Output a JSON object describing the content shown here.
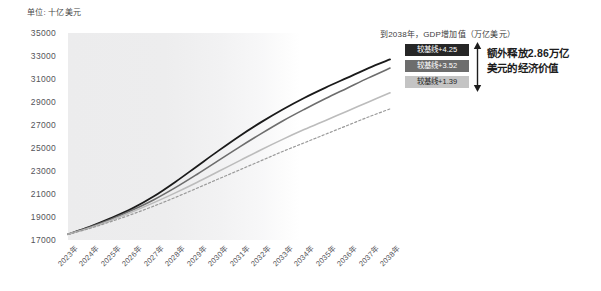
{
  "unit_label": "单位: 十亿美元",
  "annotation": {
    "title": "到2038年，GDP增加值（万亿美元）",
    "badges": [
      {
        "label": "较基线+4.25",
        "color": "#262626",
        "text_color": "#ffffff"
      },
      {
        "label": "较基线+3.52",
        "color": "#6d6d6d",
        "text_color": "#ffffff"
      },
      {
        "label": "较基线+1.39",
        "color": "#c4c4c4",
        "text_color": "#1f1f1f"
      }
    ],
    "arrow_icon": "double-headed-vertical-arrow",
    "callout_line1": "额外释放2.86万亿",
    "callout_line2": "美元的经济价值"
  },
  "chart_data": {
    "type": "line",
    "title": "",
    "xlabel": "",
    "ylabel": "单位: 十亿美元",
    "ylim": [
      17000,
      35000
    ],
    "ytick_step": 2000,
    "grid": false,
    "legend": "none",
    "categories": [
      "2023年",
      "2024年",
      "2025年",
      "2026年",
      "2027年",
      "2028年",
      "2029年",
      "2030年",
      "2031年",
      "2032年",
      "2033年",
      "2034年",
      "2035年",
      "2036年",
      "2037年",
      "2038年"
    ],
    "yticks": [
      35000,
      33000,
      31000,
      29000,
      27000,
      25000,
      23000,
      21000,
      19000,
      17000
    ],
    "series": [
      {
        "name": "较基线+4.25",
        "style": "solid",
        "color": "#1a1a1a",
        "width": 1.8,
        "values": [
          17500,
          18150,
          18900,
          19750,
          20800,
          22050,
          23400,
          24750,
          26050,
          27250,
          28350,
          29350,
          30250,
          31100,
          31950,
          32700
        ]
      },
      {
        "name": "较基线+3.52",
        "style": "solid",
        "color": "#6d6d6d",
        "width": 1.6,
        "values": [
          17500,
          18100,
          18800,
          19600,
          20500,
          21550,
          22700,
          23900,
          25100,
          26250,
          27350,
          28350,
          29300,
          30200,
          31100,
          31950
        ]
      },
      {
        "name": "较基线+1.39",
        "style": "solid",
        "color": "#bcbcbc",
        "width": 1.6,
        "values": [
          17500,
          18050,
          18700,
          19450,
          20250,
          21100,
          22000,
          22950,
          23900,
          24850,
          25750,
          26600,
          27400,
          28200,
          29000,
          29800
        ]
      },
      {
        "name": "基线",
        "style": "dashed",
        "color": "#9a9a9a",
        "width": 1.2,
        "values": [
          17500,
          18000,
          18600,
          19250,
          19950,
          20700,
          21500,
          22300,
          23100,
          23900,
          24700,
          25450,
          26200,
          26950,
          27700,
          28400
        ]
      }
    ]
  }
}
